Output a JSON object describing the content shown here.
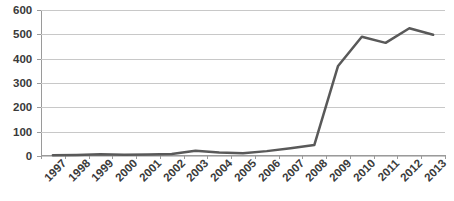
{
  "chart_data": {
    "type": "line",
    "title": "",
    "subtitle": "",
    "xlabel": "",
    "ylabel": "",
    "categories": [
      "1997",
      "1998",
      "1999",
      "2000",
      "2001",
      "2002",
      "2003",
      "2004",
      "2005",
      "2006",
      "2007",
      "2008",
      "2009",
      "2010",
      "2011",
      "2012",
      "2013"
    ],
    "values": [
      3,
      4,
      7,
      5,
      6,
      8,
      22,
      14,
      11,
      20,
      32,
      45,
      370,
      490,
      465,
      525,
      498
    ],
    "series": [
      {
        "name": "Series 1",
        "values": [
          3,
          4,
          7,
          5,
          6,
          8,
          22,
          14,
          11,
          20,
          32,
          45,
          370,
          490,
          465,
          525,
          498
        ],
        "color": "#595959"
      }
    ],
    "ylim": [
      0,
      600
    ],
    "ytick_values": [
      0,
      100,
      200,
      300,
      400,
      500,
      600
    ],
    "ytick_labels": [
      "0",
      "100",
      "200",
      "300",
      "400",
      "500",
      "600"
    ],
    "xtick_labels": [
      "1997",
      "1998",
      "1999",
      "2000",
      "2001",
      "2002",
      "2003",
      "2004",
      "2005",
      "2006",
      "2007",
      "2008",
      "2009",
      "2010",
      "2011",
      "2012",
      "2013"
    ],
    "grid": true,
    "grid_axis": "y",
    "legend": false,
    "legend_position": "none",
    "markers": false,
    "line_width": 2.5
  },
  "colors": {
    "line": "#595959",
    "gridline": "#c8c8c8",
    "axis": "#9a9a9a",
    "text": "#3a3a3a",
    "background": "#ffffff"
  }
}
